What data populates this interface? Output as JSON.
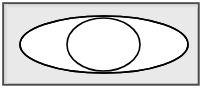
{
  "figure": {
    "type": "venn-diagram",
    "canvas": {
      "width": 205,
      "height": 89
    },
    "colors": {
      "page_background": "#ffffff",
      "universe_fill": "#e9e9e9",
      "universe_border": "#4b4b4b",
      "universe_inner_shade": "#d6d6d6",
      "set_fill": "#ffffff",
      "set_stroke": "#000000"
    },
    "universe": {
      "label": "",
      "x": 3,
      "y": 3,
      "width": 196,
      "height": 82,
      "border_width": 2
    },
    "sets": [
      {
        "name": "set-a",
        "label": "",
        "shape": "ellipse",
        "cx": 104,
        "cy": 44.5,
        "rx": 84,
        "ry": 28.5,
        "stroke_width": 1.6
      },
      {
        "name": "set-b",
        "label": "",
        "shape": "ellipse",
        "cx": 103.5,
        "cy": 44.5,
        "rx": 36.5,
        "ry": 26.5,
        "stroke_width": 1.6
      }
    ],
    "intersections": [
      {
        "name": "upper-crossing",
        "x": 104,
        "y": 20
      },
      {
        "name": "lower-crossing",
        "x": 104,
        "y": 69
      }
    ]
  }
}
